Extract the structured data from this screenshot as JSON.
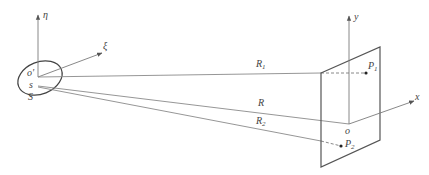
{
  "diagram": {
    "type": "geometry-schematic",
    "source_plane": {
      "axes": [
        {
          "label": "η",
          "from": [
            38,
            77
          ],
          "to": [
            38,
            14
          ]
        },
        {
          "label": "ξ",
          "from": [
            38,
            77
          ],
          "to": [
            102,
            53
          ]
        }
      ],
      "origin_label": "o'",
      "point_label": "s",
      "aperture_label": "S"
    },
    "observation_plane": {
      "axes": [
        {
          "label": "y",
          "from": [
            349,
            124
          ],
          "to": [
            349,
            16
          ]
        },
        {
          "label": "x",
          "from": [
            349,
            124
          ],
          "to": [
            414,
            101
          ]
        }
      ],
      "origin_label": "o",
      "points": [
        {
          "label": "P",
          "sub": "1",
          "pos": [
            366,
            73
          ]
        },
        {
          "label": "P",
          "sub": "2",
          "pos": [
            341,
            146
          ]
        }
      ]
    },
    "rays": [
      {
        "label": "R",
        "sub": "1"
      },
      {
        "label": "R",
        "sub": ""
      },
      {
        "label": "R",
        "sub": "2"
      }
    ]
  }
}
